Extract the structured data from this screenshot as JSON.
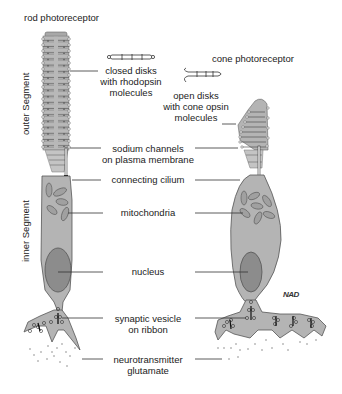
{
  "titles": {
    "rod": "rod photoreceptor",
    "cone": "cone photoreceptor"
  },
  "segments": {
    "outer": "outer Segment",
    "inner": "inner Segment"
  },
  "labels": {
    "closed_disks": [
      "closed disks",
      "with rhodopsin",
      "molecules"
    ],
    "open_disks": [
      "open disks",
      "with cone opsin",
      "molecules"
    ],
    "sodium_channels": [
      "sodium channels",
      "on plasma membrane"
    ],
    "connecting_cilium": [
      "connecting cilium"
    ],
    "mitochondria": [
      "mitochondria"
    ],
    "nucleus": [
      "nucleus"
    ],
    "synaptic_vesicle": [
      "synaptic vesicle",
      "on ribbon"
    ],
    "neurotransmitter": [
      "neurotransmitter",
      "glutamate"
    ]
  },
  "signature": "NAD",
  "colors": {
    "cell_fill": "#b4b4b4",
    "nucleus_fill": "#8c8c8c",
    "outline": "#555555",
    "line": "#333333"
  }
}
